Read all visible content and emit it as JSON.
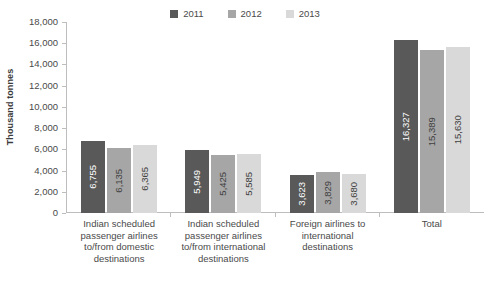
{
  "chart_data": {
    "type": "bar",
    "title": "",
    "xlabel": "",
    "ylabel": "Thousand tonnes",
    "ylim": [
      0,
      18000
    ],
    "grid": false,
    "legend_position": "top-center",
    "y_ticks": [
      "0",
      "2,000",
      "4,000",
      "6,000",
      "8,000",
      "10,000",
      "12,000",
      "14,000",
      "16,000",
      "18,000"
    ],
    "y_tick_values": [
      0,
      2000,
      4000,
      6000,
      8000,
      10000,
      12000,
      14000,
      16000,
      18000
    ],
    "categories": [
      "Indian scheduled passenger airlines to/from domestic destinations",
      "Indian scheduled passenger airlines to/from international destinations",
      "Foreign airlines to international destinations",
      "Total"
    ],
    "series": [
      {
        "name": "2011",
        "color": "#595959",
        "label_color": "#ffffff",
        "values": [
          6755,
          5949,
          3623,
          16327
        ],
        "labels": [
          "6,755",
          "5,949",
          "3,623",
          "16,327"
        ]
      },
      {
        "name": "2012",
        "color": "#a6a6a6",
        "label_color": "#404040",
        "values": [
          6135,
          5425,
          3829,
          15389
        ],
        "labels": [
          "6,135",
          "5,425",
          "3,829",
          "15,389"
        ]
      },
      {
        "name": "2013",
        "color": "#d9d9d9",
        "label_color": "#404040",
        "values": [
          6365,
          5585,
          3680,
          15630
        ],
        "labels": [
          "6,365",
          "5,585",
          "3,680",
          "15,630"
        ]
      }
    ]
  }
}
